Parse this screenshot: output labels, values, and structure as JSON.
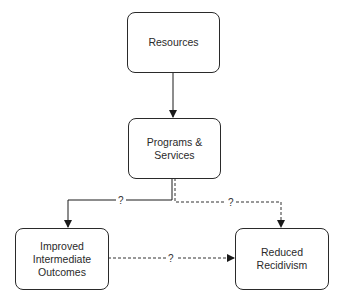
{
  "diagram": {
    "type": "flowchart",
    "nodes": [
      {
        "id": "resources",
        "label": "Resources"
      },
      {
        "id": "programs",
        "label": "Programs &\nServices"
      },
      {
        "id": "intermediate",
        "label": "Improved\nIntermediate\nOutcomes"
      },
      {
        "id": "recidivism",
        "label": "Reduced\nRecidivism"
      }
    ],
    "edges": [
      {
        "from": "resources",
        "to": "programs",
        "style": "solid",
        "label": ""
      },
      {
        "from": "programs",
        "to": "intermediate",
        "style": "solid",
        "label": "?"
      },
      {
        "from": "programs",
        "to": "recidivism",
        "style": "dashed",
        "label": "?"
      },
      {
        "from": "intermediate",
        "to": "recidivism",
        "style": "dashed",
        "label": "?"
      }
    ]
  }
}
